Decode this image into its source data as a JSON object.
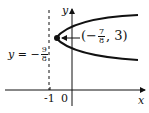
{
  "figure": {
    "type": "parabola-graph",
    "axes": {
      "x_label": "x",
      "y_label": "y",
      "tick_labels": [
        "-1",
        "0"
      ]
    },
    "directrix": {
      "label_prefix": "y = −",
      "label_num": "9",
      "label_den": "8",
      "style": "dashed"
    },
    "vertex": {
      "label_open": "(−",
      "label_num": "7",
      "label_den": "8",
      "label_close": ", 3)"
    },
    "colors": {
      "ink": "#111111",
      "background": "#ffffff"
    }
  }
}
